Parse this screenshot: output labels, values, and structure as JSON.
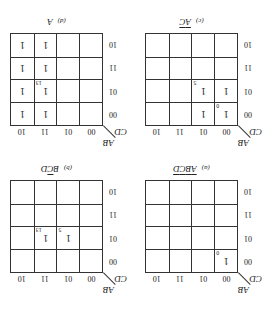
{
  "axis": {
    "row_var": "CD",
    "col_var": "AB",
    "col_labels": [
      "00",
      "01",
      "11",
      "10"
    ],
    "row_labels": [
      "00",
      "01",
      "11",
      "10"
    ]
  },
  "maps": [
    {
      "tag": "(a)",
      "title_parts": [
        {
          "t": "A",
          "bar": true
        },
        {
          "t": "B",
          "bar": true
        },
        {
          "t": "C",
          "bar": true
        },
        {
          "t": "D",
          "bar": true
        }
      ],
      "cells": [
        [
          "1",
          "",
          "",
          ""
        ],
        [
          "",
          "",
          "",
          ""
        ],
        [
          "",
          "",
          "",
          ""
        ],
        [
          "",
          "",
          "",
          ""
        ]
      ],
      "indices": [
        [
          "0",
          "",
          "",
          ""
        ],
        [
          "",
          "",
          "",
          ""
        ],
        [
          "",
          "",
          "",
          ""
        ],
        [
          "",
          "",
          "",
          ""
        ]
      ]
    },
    {
      "tag": "(b)",
      "title_parts": [
        {
          "t": "B",
          "bar": false
        },
        {
          "t": "C",
          "bar": true
        },
        {
          "t": "D",
          "bar": false
        }
      ],
      "cells": [
        [
          "",
          "",
          "",
          ""
        ],
        [
          "",
          "1",
          "1",
          ""
        ],
        [
          "",
          "",
          "",
          ""
        ],
        [
          "",
          "",
          "",
          ""
        ]
      ],
      "indices": [
        [
          "",
          "",
          "",
          ""
        ],
        [
          "",
          "5",
          "13",
          ""
        ],
        [
          "",
          "",
          "",
          ""
        ],
        [
          "",
          "",
          "",
          ""
        ]
      ]
    },
    {
      "tag": "(c)",
      "title_parts": [
        {
          "t": "A",
          "bar": true
        },
        {
          "t": "C",
          "bar": true
        }
      ],
      "cells": [
        [
          "1",
          "1",
          "",
          ""
        ],
        [
          "1",
          "1",
          "",
          ""
        ],
        [
          "",
          "",
          "",
          ""
        ],
        [
          "",
          "",
          "",
          ""
        ]
      ],
      "indices": [
        [
          "0",
          "",
          "",
          ""
        ],
        [
          "",
          "5",
          "",
          ""
        ],
        [
          "",
          "",
          "",
          ""
        ],
        [
          "",
          "",
          "",
          ""
        ]
      ]
    },
    {
      "tag": "(d)",
      "title_parts": [
        {
          "t": "A",
          "bar": false
        }
      ],
      "cells": [
        [
          "",
          "",
          "1",
          "1"
        ],
        [
          "",
          "",
          "1",
          "1"
        ],
        [
          "",
          "",
          "1",
          "1"
        ],
        [
          "",
          "",
          "1",
          "1"
        ]
      ],
      "indices": [
        [
          "",
          "",
          "",
          ""
        ],
        [
          "",
          "",
          "13",
          ""
        ],
        [
          "",
          "",
          "",
          ""
        ],
        [
          "",
          "",
          "",
          ""
        ]
      ]
    }
  ]
}
